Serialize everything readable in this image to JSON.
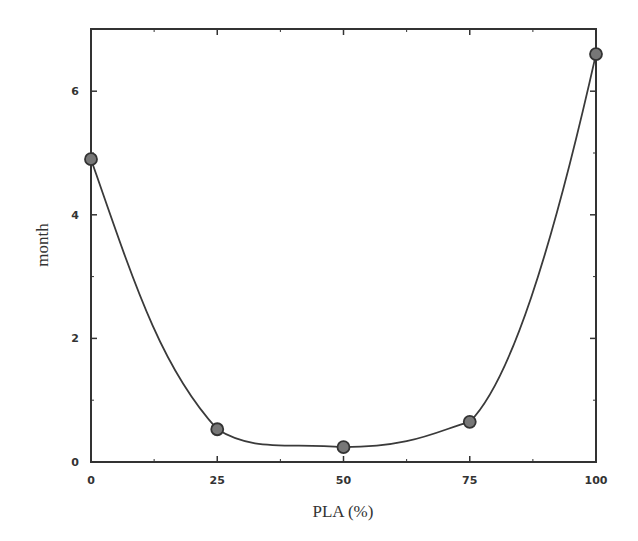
{
  "chart_data": {
    "type": "line",
    "title": "",
    "xlabel": "PLA (%)",
    "ylabel": "month",
    "x": [
      0,
      25,
      50,
      75,
      100
    ],
    "series": [
      {
        "name": "month",
        "values": [
          4.9,
          0.53,
          0.24,
          0.65,
          6.6
        ],
        "marker": "circle",
        "smooth": true
      }
    ],
    "xlim": [
      0,
      100
    ],
    "ylim": [
      0,
      7
    ],
    "xticks": [
      0,
      25,
      50,
      75,
      100
    ],
    "xtick_labels": [
      "0",
      "25",
      "50",
      "75",
      "100"
    ],
    "yticks": [
      0,
      2,
      4,
      6
    ],
    "ytick_labels": [
      "0",
      "2",
      "4",
      "6"
    ],
    "grid": false,
    "legend": null,
    "colors": {
      "line": "#3a3a3a",
      "marker_fill": "#777777",
      "axis": "#333333"
    }
  }
}
